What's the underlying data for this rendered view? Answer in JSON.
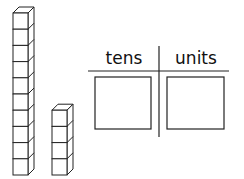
{
  "diagram": {
    "blocks": {
      "tall_column_cubes": 10,
      "short_column_cubes": 4
    },
    "place_value_chart": {
      "columns": [
        {
          "label": "tens"
        },
        {
          "label": "units"
        }
      ]
    }
  }
}
